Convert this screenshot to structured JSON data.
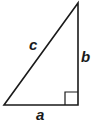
{
  "diagram": {
    "type": "right-triangle",
    "stroke_color": "#1a1a1a",
    "background": "#ffffff",
    "vertices": {
      "bottom_left": [
        4,
        105
      ],
      "bottom_right": [
        78,
        105
      ],
      "top": [
        78,
        3
      ]
    },
    "right_angle_marker": {
      "x": 65,
      "y": 92,
      "size": 13
    },
    "labels": {
      "a": "a",
      "b": "b",
      "c": "c"
    }
  }
}
